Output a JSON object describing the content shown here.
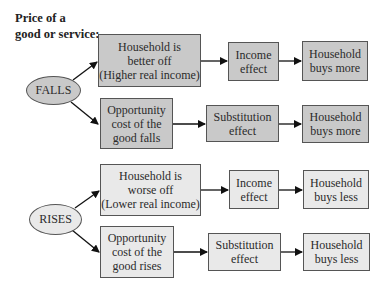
{
  "title": {
    "line1": "Price of a",
    "line2": "good or service:"
  },
  "sections": [
    {
      "trigger": "FALLS",
      "fill": "#c9c9c9",
      "rows": [
        {
          "cause": [
            "Household is",
            "better off",
            "(Higher real income)"
          ],
          "effect": [
            "Income",
            "effect"
          ],
          "result": [
            "Household",
            "buys more"
          ]
        },
        {
          "cause": [
            "Opportunity",
            "cost of the",
            "good falls"
          ],
          "effect": [
            "Substitution",
            "effect"
          ],
          "result": [
            "Household",
            "buys more"
          ]
        }
      ]
    },
    {
      "trigger": "RISES",
      "fill": "#e9e9e9",
      "rows": [
        {
          "cause": [
            "Household is",
            "worse off",
            "(Lower real income)"
          ],
          "effect": [
            "Income",
            "effect"
          ],
          "result": [
            "Household",
            "buys less"
          ]
        },
        {
          "cause": [
            "Opportunity",
            "cost of the",
            "good rises"
          ],
          "effect": [
            "Substitution",
            "effect"
          ],
          "result": [
            "Household",
            "buys less"
          ]
        }
      ]
    }
  ]
}
